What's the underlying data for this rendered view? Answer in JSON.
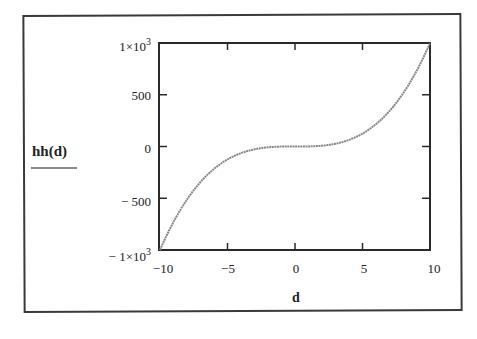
{
  "chart_data": {
    "type": "line",
    "title": "",
    "xlabel": "d",
    "ylabel": "hh(d)",
    "xlim": [
      -10,
      10
    ],
    "ylim": [
      -1000,
      1000
    ],
    "grid": false,
    "legend_position": "left",
    "x_ticks": [
      -10,
      -5,
      0,
      5,
      10
    ],
    "x_tick_labels": [
      "−10",
      "−5",
      "0",
      "5",
      "10"
    ],
    "y_ticks": [
      1000,
      500,
      0,
      -500,
      -1000
    ],
    "y_tick_labels": [
      "1×10",
      "500",
      "0",
      "− 500",
      "− 1×10"
    ],
    "y_tick_exponents": [
      "3",
      "",
      "",
      "",
      "3"
    ],
    "series": [
      {
        "name": "hh(d)",
        "color": "#888888",
        "x": [
          -10,
          -9,
          -8,
          -7,
          -6,
          -5,
          -4,
          -3,
          -2,
          -1,
          0,
          1,
          2,
          3,
          4,
          5,
          6,
          7,
          8,
          9,
          10
        ],
        "values": [
          -1000,
          -729,
          -512,
          -343,
          -216,
          -125,
          -64,
          -27,
          -8,
          -1,
          0,
          1,
          8,
          27,
          64,
          125,
          216,
          343,
          512,
          729,
          1000
        ]
      }
    ]
  },
  "legend": {
    "label": "hh(d)"
  },
  "axis": {
    "x_label": "d"
  }
}
